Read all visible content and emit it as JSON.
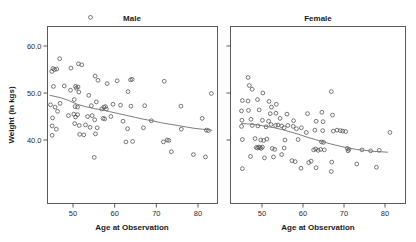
{
  "figure": {
    "background": "#ffffff",
    "marker_color": "#555555",
    "line_color": "#6e6e6e",
    "axis_color": "#5a5a5a"
  },
  "axes": {
    "ylabel": "Weight (in kgs)",
    "xlabel_left": "Age at Observation",
    "xlabel_right": "Age at Observation",
    "ytick_labels": [
      "40.0",
      "50.0",
      "60.0"
    ],
    "ytick_values": [
      40,
      50,
      60
    ],
    "xtick_labels": [
      "50",
      "60",
      "70",
      "80"
    ],
    "xtick_values": [
      50,
      60,
      70,
      80
    ],
    "xlim": [
      44,
      85
    ],
    "ylim": [
      29,
      67.5
    ]
  },
  "panels": [
    {
      "title": "Male"
    },
    {
      "title": "Female"
    }
  ],
  "chart_data": {
    "type": "scatter",
    "title": "",
    "xlabel": "Age at Observation",
    "ylabel": "Weight (in kgs)",
    "xlim": [
      44,
      85
    ],
    "ylim": [
      29,
      67.5
    ],
    "grid": false,
    "legend": "none",
    "facets": [
      "Male",
      "Female"
    ],
    "series": [
      {
        "name": "Male",
        "facet": "Male",
        "points": [
          [
            54.2,
            66.1
          ],
          [
            46.8,
            57.3
          ],
          [
            51.3,
            56.2
          ],
          [
            52.1,
            56.0
          ],
          [
            45.2,
            55.2
          ],
          [
            45.6,
            55.0
          ],
          [
            46.1,
            55.1
          ],
          [
            49.5,
            55.3
          ],
          [
            44.9,
            54.6
          ],
          [
            55.3,
            53.6
          ],
          [
            56.0,
            52.7
          ],
          [
            45.3,
            51.4
          ],
          [
            47.9,
            51.5
          ],
          [
            50.6,
            51.4
          ],
          [
            51.2,
            51.3
          ],
          [
            50.8,
            51.0
          ],
          [
            58.2,
            52.0
          ],
          [
            60.6,
            52.6
          ],
          [
            63.8,
            52.8
          ],
          [
            64.2,
            52.9
          ],
          [
            71.9,
            52.5
          ],
          [
            83.2,
            49.9
          ],
          [
            49.4,
            50.6
          ],
          [
            51.4,
            50.2
          ],
          [
            53.8,
            49.5
          ],
          [
            63.2,
            50.3
          ],
          [
            44.6,
            47.5
          ],
          [
            45.7,
            47.0
          ],
          [
            46.9,
            47.8
          ],
          [
            50.3,
            48.6
          ],
          [
            50.5,
            47.1
          ],
          [
            51.1,
            47.0
          ],
          [
            54.4,
            47.3
          ],
          [
            55.6,
            48.1
          ],
          [
            56.9,
            46.6
          ],
          [
            57.4,
            47.0
          ],
          [
            57.8,
            47.1
          ],
          [
            58.0,
            46.6
          ],
          [
            59.6,
            47.6
          ],
          [
            61.4,
            47.4
          ],
          [
            63.9,
            47.2
          ],
          [
            67.2,
            47.3
          ],
          [
            75.9,
            47.2
          ],
          [
            45.1,
            44.7
          ],
          [
            46.3,
            46.1
          ],
          [
            48.9,
            45.2
          ],
          [
            50.2,
            45.5
          ],
          [
            50.6,
            44.9
          ],
          [
            51.1,
            45.4
          ],
          [
            53.5,
            45.0
          ],
          [
            54.6,
            45.2
          ],
          [
            55.2,
            44.3
          ],
          [
            57.2,
            44.6
          ],
          [
            57.6,
            44.5
          ],
          [
            59.1,
            45.0
          ],
          [
            62.0,
            44.0
          ],
          [
            68.8,
            44.1
          ],
          [
            81.0,
            44.6
          ],
          [
            45.0,
            43.0
          ],
          [
            46.0,
            42.3
          ],
          [
            50.4,
            43.5
          ],
          [
            51.5,
            43.1
          ],
          [
            53.0,
            43.2
          ],
          [
            54.1,
            42.7
          ],
          [
            55.8,
            42.6
          ],
          [
            63.1,
            42.4
          ],
          [
            66.9,
            42.6
          ],
          [
            76.0,
            42.3
          ],
          [
            82.5,
            42.0
          ],
          [
            82.0,
            42.1
          ],
          [
            45.0,
            41.0
          ],
          [
            51.6,
            41.2
          ],
          [
            52.6,
            41.1
          ],
          [
            55.4,
            41.3
          ],
          [
            62.7,
            39.6
          ],
          [
            64.3,
            39.7
          ],
          [
            71.7,
            39.6
          ],
          [
            72.6,
            40.0
          ],
          [
            73.0,
            39.9
          ],
          [
            73.6,
            37.5
          ],
          [
            78.9,
            36.9
          ],
          [
            81.8,
            36.4
          ],
          [
            55.1,
            36.3
          ]
        ]
      },
      {
        "name": "Female",
        "facet": "Female",
        "points": [
          [
            46.6,
            53.3
          ],
          [
            46.9,
            51.6
          ],
          [
            47.6,
            50.8
          ],
          [
            50.2,
            50.0
          ],
          [
            66.9,
            50.3
          ],
          [
            45.2,
            48.4
          ],
          [
            46.6,
            48.3
          ],
          [
            48.9,
            48.6
          ],
          [
            51.7,
            48.2
          ],
          [
            52.3,
            47.0
          ],
          [
            53.5,
            47.6
          ],
          [
            45.0,
            46.2
          ],
          [
            46.7,
            46.3
          ],
          [
            49.3,
            46.4
          ],
          [
            52.0,
            45.6
          ],
          [
            53.4,
            45.7
          ],
          [
            56.1,
            45.5
          ],
          [
            61.1,
            45.6
          ],
          [
            64.6,
            45.9
          ],
          [
            67.2,
            45.3
          ],
          [
            45.1,
            44.2
          ],
          [
            47.3,
            44.4
          ],
          [
            50.1,
            44.2
          ],
          [
            51.6,
            44.0
          ],
          [
            54.4,
            44.6
          ],
          [
            57.7,
            44.1
          ],
          [
            63.2,
            44.0
          ],
          [
            64.9,
            43.9
          ],
          [
            45.0,
            42.9
          ],
          [
            47.6,
            43.1
          ],
          [
            49.0,
            43.0
          ],
          [
            51.0,
            42.8
          ],
          [
            52.2,
            43.3
          ],
          [
            53.3,
            43.1
          ],
          [
            53.9,
            43.2
          ],
          [
            54.8,
            43.0
          ],
          [
            55.4,
            42.6
          ],
          [
            56.3,
            43.1
          ],
          [
            57.6,
            42.9
          ],
          [
            58.4,
            42.4
          ],
          [
            59.6,
            42.6
          ],
          [
            60.8,
            41.6
          ],
          [
            62.9,
            42.1
          ],
          [
            64.8,
            42.0
          ],
          [
            67.4,
            41.9
          ],
          [
            68.3,
            42.1
          ],
          [
            69.1,
            42.0
          ],
          [
            69.7,
            41.9
          ],
          [
            70.4,
            41.8
          ],
          [
            81.2,
            41.6
          ],
          [
            45.2,
            40.1
          ],
          [
            48.3,
            40.3
          ],
          [
            49.7,
            40.0
          ],
          [
            50.4,
            39.9
          ],
          [
            51.2,
            40.2
          ],
          [
            55.6,
            40.0
          ],
          [
            58.8,
            40.1
          ],
          [
            64.5,
            39.6
          ],
          [
            65.0,
            39.5
          ],
          [
            48.6,
            38.4
          ],
          [
            48.9,
            38.3
          ],
          [
            49.2,
            38.5
          ],
          [
            49.5,
            38.4
          ],
          [
            49.8,
            38.2
          ],
          [
            50.1,
            38.5
          ],
          [
            52.5,
            38.2
          ],
          [
            53.1,
            38.0
          ],
          [
            55.4,
            38.3
          ],
          [
            62.6,
            37.9
          ],
          [
            63.1,
            38.1
          ],
          [
            63.7,
            37.8
          ],
          [
            64.3,
            38.0
          ],
          [
            65.2,
            37.9
          ],
          [
            70.8,
            38.2
          ],
          [
            71.0,
            37.7
          ],
          [
            71.2,
            38.0
          ],
          [
            74.4,
            37.9
          ],
          [
            76.5,
            37.7
          ],
          [
            78.6,
            37.8
          ],
          [
            47.2,
            36.5
          ],
          [
            50.6,
            36.2
          ],
          [
            52.8,
            36.4
          ],
          [
            57.3,
            35.6
          ],
          [
            58.1,
            35.4
          ],
          [
            61.4,
            35.2
          ],
          [
            62.0,
            35.5
          ],
          [
            67.0,
            35.3
          ],
          [
            73.1,
            34.9
          ],
          [
            54.8,
            36.9
          ],
          [
            45.2,
            33.9
          ],
          [
            59.5,
            34.0
          ],
          [
            63.2,
            34.1
          ],
          [
            77.9,
            34.2
          ],
          [
            66.9,
            33.3
          ]
        ]
      }
    ],
    "trend_lines": [
      {
        "name": "Male loess",
        "facet": "Male",
        "points": [
          [
            44.5,
            49.5
          ],
          [
            47.0,
            49.0
          ],
          [
            49.0,
            48.4
          ],
          [
            51.0,
            47.6
          ],
          [
            53.0,
            47.1
          ],
          [
            55.0,
            46.7
          ],
          [
            57.0,
            46.4
          ],
          [
            59.0,
            46.0
          ],
          [
            61.0,
            45.6
          ],
          [
            63.0,
            45.2
          ],
          [
            65.0,
            44.8
          ],
          [
            67.0,
            44.4
          ],
          [
            69.0,
            44.1
          ],
          [
            71.0,
            43.7
          ],
          [
            73.0,
            43.4
          ],
          [
            75.0,
            43.1
          ],
          [
            77.0,
            42.8
          ],
          [
            79.0,
            42.5
          ],
          [
            81.0,
            42.3
          ],
          [
            83.3,
            42.1
          ]
        ]
      },
      {
        "name": "Female loess",
        "facet": "Female",
        "points": [
          [
            45.0,
            43.5
          ],
          [
            47.0,
            43.4
          ],
          [
            49.0,
            43.2
          ],
          [
            51.0,
            42.9
          ],
          [
            53.0,
            42.6
          ],
          [
            55.0,
            42.2
          ],
          [
            57.0,
            41.7
          ],
          [
            59.0,
            41.2
          ],
          [
            61.0,
            40.6
          ],
          [
            63.0,
            40.1
          ],
          [
            65.0,
            39.6
          ],
          [
            67.0,
            39.1
          ],
          [
            69.0,
            38.7
          ],
          [
            71.0,
            38.3
          ],
          [
            73.0,
            38.0
          ],
          [
            75.0,
            37.8
          ],
          [
            77.0,
            37.6
          ],
          [
            79.0,
            37.5
          ],
          [
            80.6,
            37.4
          ]
        ]
      }
    ]
  }
}
